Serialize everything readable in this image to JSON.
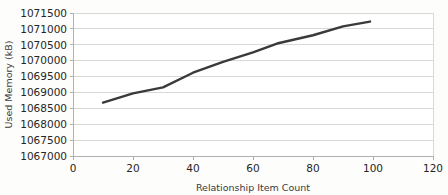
{
  "chart_data": {
    "type": "line",
    "title": "",
    "xlabel": "Relationship Item Count",
    "ylabel": "Used Memory (kB)",
    "xlim": [
      0,
      120
    ],
    "ylim": [
      1067000,
      1071500
    ],
    "xticks": [
      0,
      20,
      40,
      60,
      80,
      100,
      120
    ],
    "xtick_labels": [
      "0",
      "20",
      "40",
      "60",
      "80",
      "100",
      "120"
    ],
    "yticks": [
      1067000,
      1067500,
      1068000,
      1068500,
      1069000,
      1069500,
      1070000,
      1070500,
      1071000,
      1071500
    ],
    "ytick_labels": [
      "1067000",
      "1067500",
      "1068000",
      "1068500",
      "1069000",
      "1069500",
      "1070000",
      "1070500",
      "1071000",
      "1071500"
    ],
    "grid": "horizontal",
    "legend": "none",
    "series": [
      {
        "name": "Used Memory",
        "color": "#3a3a3a",
        "line_width": 2.4,
        "x": [
          10,
          20,
          30,
          40,
          50,
          60,
          68,
          80,
          90,
          99
        ],
        "values": [
          1068680,
          1068970,
          1069160,
          1069620,
          1069960,
          1070260,
          1070540,
          1070800,
          1071080,
          1071230
        ]
      }
    ]
  },
  "colors": {
    "background": "#fdfdfc",
    "plot_background": "#ffffff",
    "gridline": "#d9d9d9",
    "axis_line": "#b0b0b0",
    "series_line": "#3a3a3a",
    "tick_text": "#262626",
    "title_text": "#3a3a3a"
  }
}
